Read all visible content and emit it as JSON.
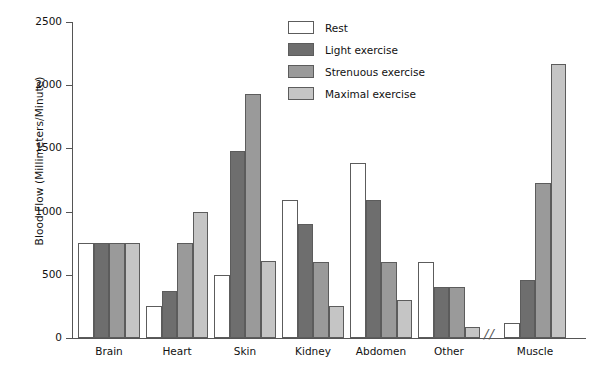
{
  "chart_data": {
    "type": "bar",
    "title": "",
    "xlabel": "",
    "ylabel": "Blood Flow (Millimeters/Minute)",
    "ylim": [
      0,
      2500
    ],
    "yticks": [
      0,
      500,
      1000,
      1500,
      2000,
      2500
    ],
    "grid": false,
    "legend_position": "top-center",
    "axis_break_after_category": "Other",
    "axis_break_symbol": "//",
    "categories": [
      "Brain",
      "Heart",
      "Skin",
      "Kidney",
      "Abdomen",
      "Other",
      "Muscle"
    ],
    "series": [
      {
        "name": "Rest",
        "color": "#ffffff",
        "values": [
          750,
          250,
          500,
          1090,
          1385,
          600,
          120
        ]
      },
      {
        "name": "Light exercise",
        "color": "#6e6e6e",
        "values": [
          750,
          370,
          1480,
          900,
          1090,
          400,
          460
        ]
      },
      {
        "name": "Strenuous exercise",
        "color": "#9a9a9a",
        "values": [
          750,
          750,
          1930,
          600,
          600,
          400,
          1230
        ]
      },
      {
        "name": "Maximal exercise",
        "color": "#c5c5c5",
        "values": [
          750,
          1000,
          610,
          250,
          300,
          90,
          2170
        ]
      }
    ]
  },
  "axis": {
    "y_title": "Blood Flow (Millimeters/Minute)",
    "tick_labels": [
      "0",
      "500",
      "1000",
      "1500",
      "2000",
      "2500"
    ]
  },
  "legend": {
    "items": [
      {
        "label": "Rest",
        "color": "#ffffff"
      },
      {
        "label": "Light exercise",
        "color": "#6e6e6e"
      },
      {
        "label": "Strenuous exercise",
        "color": "#9a9a9a"
      },
      {
        "label": "Maximal exercise",
        "color": "#c5c5c5"
      }
    ]
  },
  "break_marker": "//"
}
